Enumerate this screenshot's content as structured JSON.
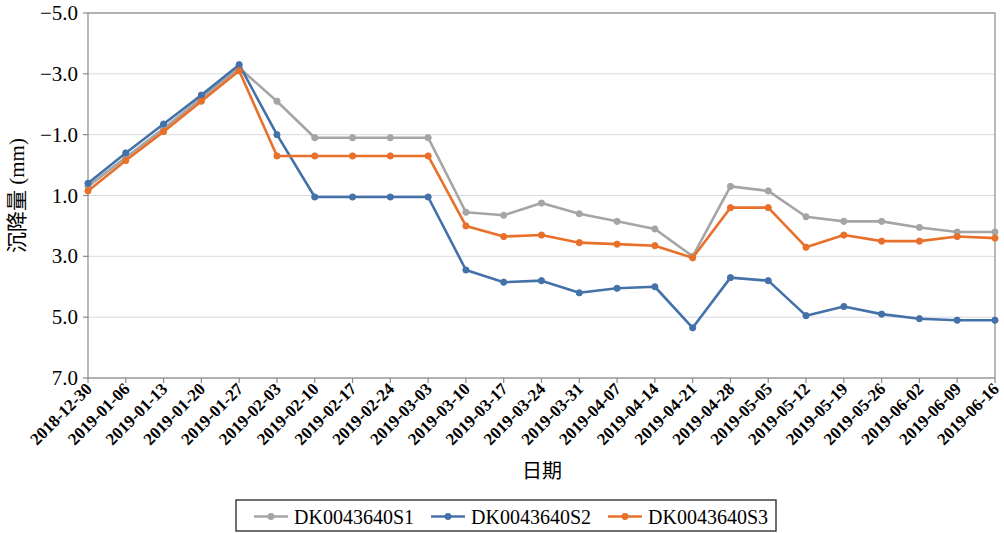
{
  "chart_data": {
    "type": "line",
    "title": "",
    "xlabel": "日期",
    "ylabel": "沉降量 (mm)",
    "y_inverted": true,
    "ylim": [
      -5.0,
      7.0
    ],
    "yticks": [
      "-5.0",
      "-3.0",
      "-1.0",
      "1.0",
      "3.0",
      "5.0",
      "7.0"
    ],
    "ytick_values": [
      -5.0,
      -3.0,
      -1.0,
      1.0,
      3.0,
      5.0,
      7.0
    ],
    "grid": true,
    "grid_axis": "y",
    "legend_position": "bottom",
    "categories": [
      "2018-12-30",
      "2019-01-06",
      "2019-01-13",
      "2019-01-20",
      "2019-01-27",
      "2019-02-03",
      "2019-02-10",
      "2019-02-17",
      "2019-02-24",
      "2019-03-03",
      "2019-03-10",
      "2019-03-17",
      "2019-03-24",
      "2019-03-31",
      "2019-04-07",
      "2019-04-14",
      "2019-04-21",
      "2019-04-28",
      "2019-05-05",
      "2019-05-12",
      "2019-05-19",
      "2019-05-26",
      "2019-06-02",
      "2019-06-09",
      "2019-06-16"
    ],
    "series": [
      {
        "name": "DK0043640S1",
        "color": "#A5A5A5",
        "marker": "circle",
        "values": [
          0.7,
          -0.25,
          -1.2,
          -2.2,
          -3.2,
          -2.1,
          -0.9,
          -0.9,
          -0.9,
          -0.9,
          1.55,
          1.65,
          1.25,
          1.6,
          1.85,
          2.1,
          3.0,
          0.7,
          0.85,
          1.7,
          1.85,
          1.85,
          2.05,
          2.2,
          2.2
        ]
      },
      {
        "name": "DK0043640S2",
        "color": "#4472A8",
        "marker": "circle",
        "values": [
          0.6,
          -0.4,
          -1.35,
          -2.3,
          -3.3,
          -1.0,
          1.05,
          1.05,
          1.05,
          1.05,
          3.45,
          3.85,
          3.8,
          4.2,
          4.05,
          4.0,
          5.35,
          3.7,
          3.8,
          4.95,
          4.65,
          4.9,
          5.05,
          5.1,
          5.1
        ]
      },
      {
        "name": "DK0043640S3",
        "color": "#E8702A",
        "marker": "circle",
        "values": [
          0.85,
          -0.15,
          -1.1,
          -2.1,
          -3.1,
          -0.3,
          -0.3,
          -0.3,
          -0.3,
          -0.3,
          2.0,
          2.35,
          2.3,
          2.55,
          2.6,
          2.65,
          3.05,
          1.4,
          1.4,
          2.7,
          2.3,
          2.5,
          2.5,
          2.35,
          2.4
        ]
      }
    ]
  },
  "legend": {
    "items": [
      {
        "label": "DK0043640S1",
        "color": "#A5A5A5"
      },
      {
        "label": "DK0043640S2",
        "color": "#4472A8"
      },
      {
        "label": "DK0043640S3",
        "color": "#E8702A"
      }
    ]
  },
  "axes": {
    "x_title": "日期",
    "y_title": "沉降量 (mm)"
  }
}
